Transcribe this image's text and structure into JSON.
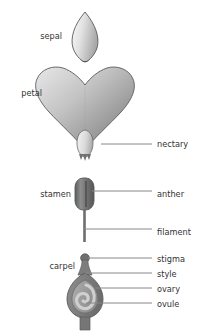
{
  "diagram": {
    "background_color": "#ffffff",
    "label_color": "#333333",
    "leader_color": "#888888",
    "outline_color": "#5a5a5a"
  },
  "parts": {
    "sepal": {
      "label": "sepal",
      "side": "left",
      "label_x": 62,
      "label_y": 36,
      "fill_light": "#f2f2f2",
      "fill_dark": "#a8a8a8"
    },
    "petal": {
      "label": "petal",
      "side": "left",
      "label_x": 42,
      "label_y": 93,
      "fill_light": "#d8d8d8",
      "fill_dark": "#8a8a8a"
    },
    "nectary": {
      "label": "nectary",
      "side": "right",
      "label_x": 157,
      "label_y": 147,
      "leader_x1": 101,
      "leader_x2": 152,
      "leader_y": 144,
      "fill_light": "#efefef",
      "fill_dark": "#b5b5b5"
    },
    "stamen": {
      "label": "stamen",
      "side": "left",
      "label_x": 78,
      "label_y": 194
    },
    "anther": {
      "label": "anther",
      "side": "right",
      "label_x": 157,
      "label_y": 194,
      "leader_x1": 92,
      "leader_x2": 152,
      "leader_y": 191,
      "fill_light": "#9a9a9a",
      "fill_dark": "#5e5e5e"
    },
    "filament": {
      "label": "filament",
      "side": "right",
      "label_x": 157,
      "label_y": 232,
      "leader_x1": 84,
      "leader_x2": 152,
      "leader_y": 229,
      "fill": "#6e6e6e"
    },
    "carpel": {
      "label": "carpel",
      "side": "left",
      "label_x": 75,
      "label_y": 266
    },
    "stigma": {
      "label": "stigma",
      "side": "right",
      "label_x": 157,
      "label_y": 261,
      "leader_x1": 86,
      "leader_x2": 152,
      "leader_y": 258,
      "fill": "#7a7a7a"
    },
    "style": {
      "label": "style",
      "side": "right",
      "label_x": 157,
      "label_y": 276,
      "leader_x1": 85,
      "leader_x2": 152,
      "leader_y": 273,
      "fill": "#7a7a7a"
    },
    "ovary": {
      "label": "ovary",
      "side": "right",
      "label_x": 157,
      "label_y": 291,
      "leader_x1": 92,
      "leader_x2": 152,
      "leader_y": 288,
      "fill_outer": "#808080",
      "fill_inner": "#9e9e9e"
    },
    "ovule": {
      "label": "ovule",
      "side": "right",
      "label_x": 157,
      "label_y": 306,
      "leader_x1": 84,
      "leader_x2": 152,
      "leader_y": 303,
      "fill": "#c4c4c4"
    }
  }
}
